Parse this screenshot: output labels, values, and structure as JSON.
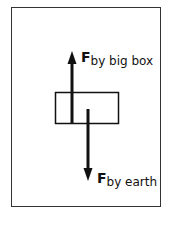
{
  "diagram": {
    "type": "free-body diagram",
    "object": "box",
    "forces": [
      {
        "symbol": "F",
        "subscript": "by big box",
        "direction": "up"
      },
      {
        "symbol": "F",
        "subscript": "by earth",
        "direction": "down"
      }
    ]
  },
  "labels": {
    "up_force_symbol": "F",
    "up_force_subscript": "by big box",
    "down_force_symbol": "F",
    "down_force_subscript": "by earth"
  }
}
